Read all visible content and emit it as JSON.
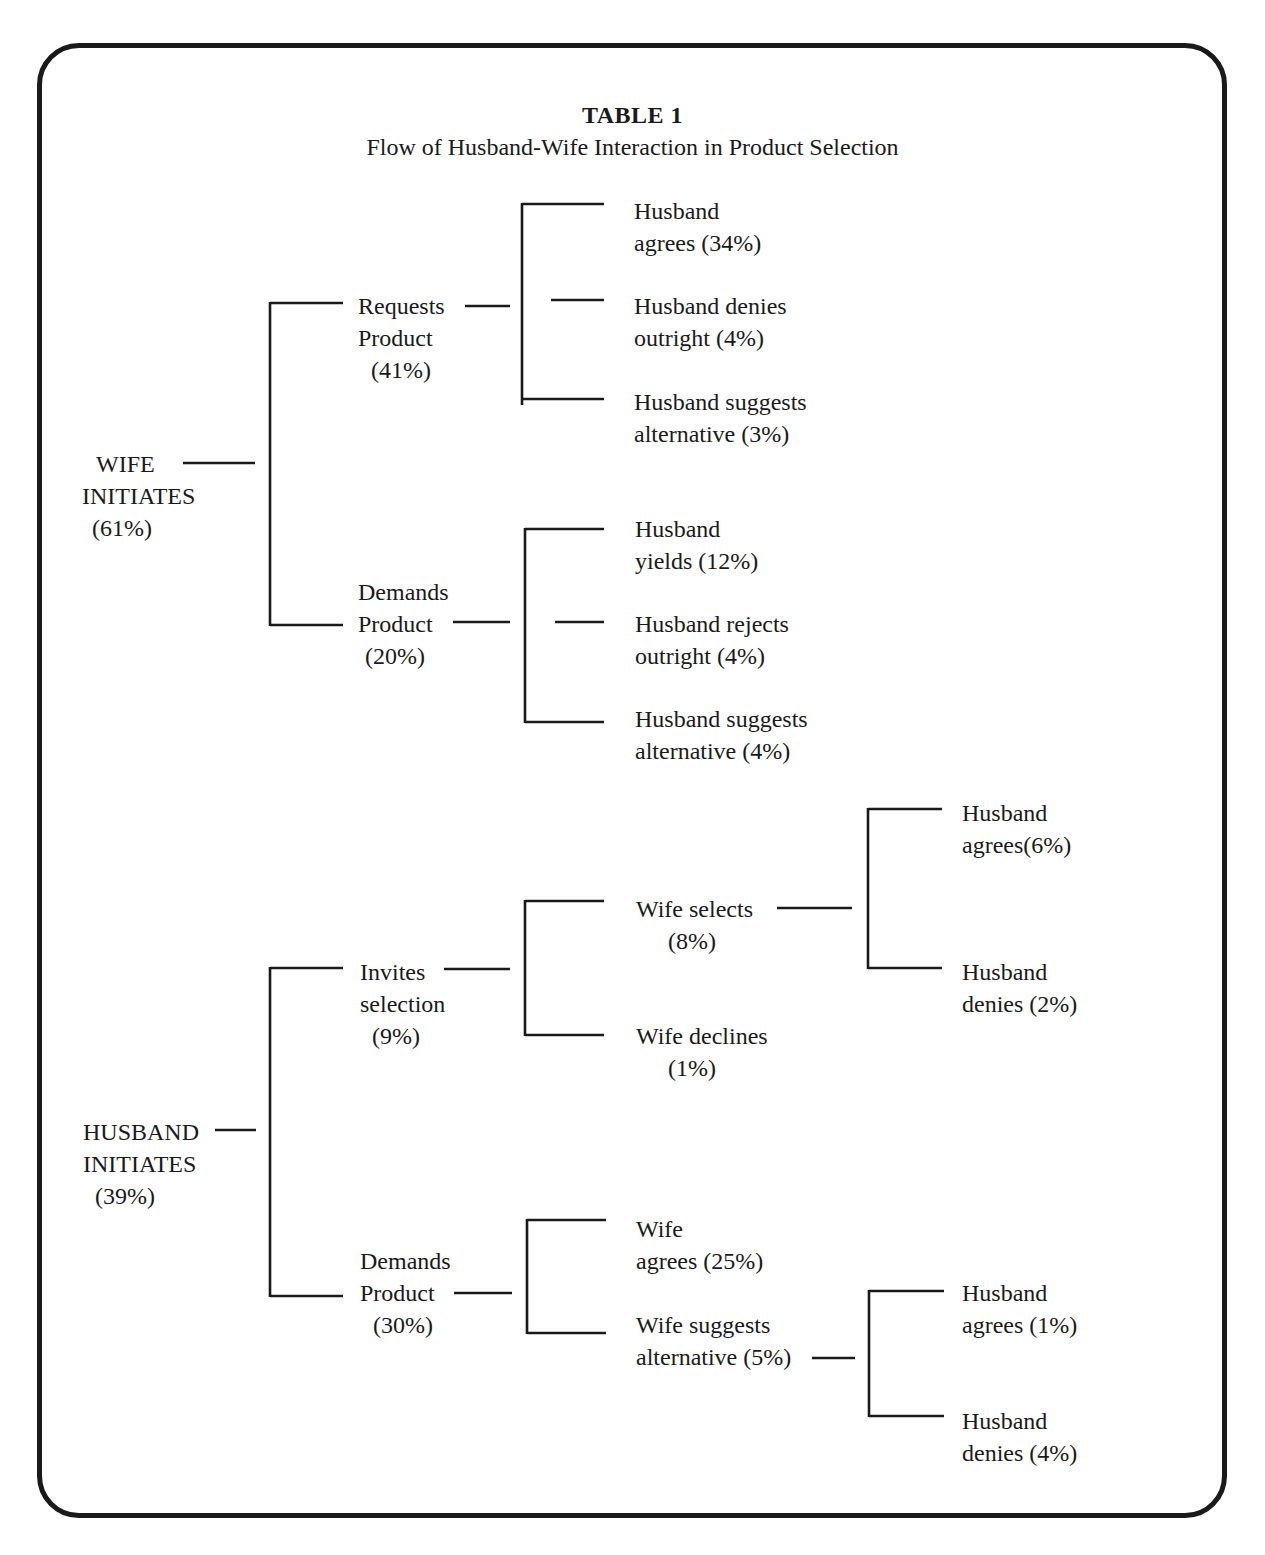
{
  "title": "TABLE 1",
  "subtitle": "Flow of Husband-Wife Interaction in Product Selection",
  "tree": {
    "wife_initiates": {
      "label_line1": "WIFE",
      "label_line2": "INITIATES",
      "pct": "(61%)",
      "requests": {
        "line1": "Requests",
        "line2": "Product",
        "pct": "(41%)",
        "outcomes": [
          {
            "line1": "Husband",
            "line2": "agrees (34%)"
          },
          {
            "line1": "Husband denies",
            "line2": "outright (4%)"
          },
          {
            "line1": "Husband suggests",
            "line2": "alternative (3%)"
          }
        ]
      },
      "demands": {
        "line1": "Demands",
        "line2": "Product",
        "pct": "(20%)",
        "outcomes": [
          {
            "line1": "Husband",
            "line2": "yields (12%)"
          },
          {
            "line1": "Husband rejects",
            "line2": "outright (4%)"
          },
          {
            "line1": "Husband suggests",
            "line2": "alternative (4%)"
          }
        ]
      }
    },
    "husband_initiates": {
      "label_line1": "HUSBAND",
      "label_line2": "INITIATES",
      "pct": "(39%)",
      "invites": {
        "line1": "Invites",
        "line2": "selection",
        "pct": "(9%)",
        "wife_selects": {
          "line1": "Wife selects",
          "pct": "(8%)",
          "outcomes": [
            {
              "line1": "Husband",
              "line2": "agrees(6%)"
            },
            {
              "line1": "Husband",
              "line2": "denies (2%)"
            }
          ]
        },
        "wife_declines": {
          "line1": "Wife declines",
          "pct": "(1%)"
        }
      },
      "demands": {
        "line1": "Demands",
        "line2": "Product",
        "pct": "(30%)",
        "wife_agrees": {
          "line1": "Wife",
          "line2": "agrees (25%)"
        },
        "wife_suggests": {
          "line1": "Wife suggests",
          "line2": "alternative (5%)",
          "outcomes": [
            {
              "line1": "Husband",
              "line2": "agrees (1%)"
            },
            {
              "line1": "Husband",
              "line2": "denies (4%)"
            }
          ]
        }
      }
    }
  }
}
